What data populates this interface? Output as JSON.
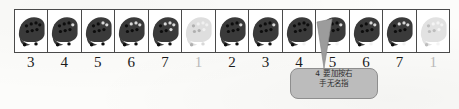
{
  "document": {
    "type": "ocarina-fingering-chart",
    "description": "Row of 12-hole ocarina fingering diagrams with scale-degree numbers"
  },
  "chart": {
    "cell_count": 13,
    "cells": [
      {
        "label": "3",
        "faded": false,
        "holes_covered": 9,
        "icon": "ocarina-fingering-icon"
      },
      {
        "label": "4",
        "faded": false,
        "holes_covered": 8,
        "icon": "ocarina-fingering-icon"
      },
      {
        "label": "5",
        "faded": false,
        "holes_covered": 7,
        "icon": "ocarina-fingering-icon"
      },
      {
        "label": "6",
        "faded": false,
        "holes_covered": 6,
        "icon": "ocarina-fingering-icon"
      },
      {
        "label": "7",
        "faded": false,
        "holes_covered": 5,
        "icon": "ocarina-fingering-icon"
      },
      {
        "label": "1",
        "faded": true,
        "holes_covered": 4,
        "icon": "ocarina-fingering-icon"
      },
      {
        "label": "2",
        "faded": false,
        "holes_covered": 8,
        "icon": "ocarina-fingering-icon"
      },
      {
        "label": "3",
        "faded": false,
        "holes_covered": 8,
        "icon": "ocarina-fingering-icon"
      },
      {
        "label": "4",
        "faded": false,
        "holes_covered": 9,
        "icon": "ocarina-fingering-icon"
      },
      {
        "label": "5",
        "faded": false,
        "holes_covered": 8,
        "icon": "ocarina-fingering-icon"
      },
      {
        "label": "6",
        "faded": false,
        "holes_covered": 7,
        "icon": "ocarina-fingering-icon"
      },
      {
        "label": "7",
        "faded": false,
        "holes_covered": 6,
        "icon": "ocarina-fingering-icon"
      },
      {
        "label": "1",
        "faded": true,
        "holes_covered": 5,
        "icon": "ocarina-fingering-icon"
      }
    ]
  },
  "callout": {
    "icon": "callout-pointer-icon",
    "points_to_cell_label": "4",
    "line1": "4 要加按右",
    "line2": "手无名指",
    "full_text": "4 要加按右手无名指"
  },
  "colors": {
    "ink": "#1b1b1b",
    "border": "#4a4a4a",
    "body_dark": "#3a3a3a",
    "body_faded": "#cfcfcf",
    "callout_fill": "#bcbcbc",
    "callout_stroke": "#8e8e8e",
    "paper": "#fcfcfa"
  }
}
